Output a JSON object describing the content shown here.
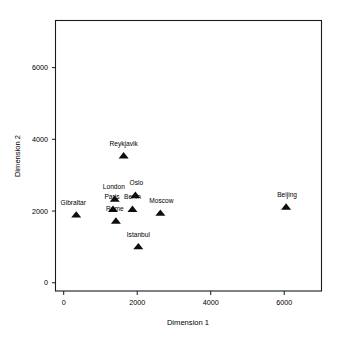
{
  "chart_data": {
    "type": "scatter",
    "title": "",
    "xlabel": "Dimension 1",
    "ylabel": "Dimension 2",
    "xlim": [
      -210,
      7000
    ],
    "ylim": [
      -230,
      7300
    ],
    "xticks": [
      0,
      2000,
      4000,
      6000
    ],
    "yticks": [
      0,
      2000,
      4000,
      6000
    ],
    "xticklabels": [
      "0",
      "2000",
      "4000",
      "6000"
    ],
    "yticklabels": [
      "0",
      "2000",
      "4000",
      "6000"
    ],
    "grid": false,
    "legend": false,
    "marker": "triangle",
    "marker_color": "#0d0d0d",
    "points": [
      {
        "label": "Gibraltar",
        "x": 340,
        "y": 1850,
        "label_dx": -3,
        "label_dy": -6
      },
      {
        "label": "Paris",
        "x": 1340,
        "y": 2010,
        "label_dx": -1,
        "label_dy": -6
      },
      {
        "label": "London",
        "x": 1390,
        "y": 2290,
        "label_dx": -1,
        "label_dy": -6
      },
      {
        "label": "Rome",
        "x": 1420,
        "y": 1680,
        "label_dx": -1,
        "label_dy": -6
      },
      {
        "label": "Reykjavik",
        "x": 1630,
        "y": 3500,
        "label_dx": 0,
        "label_dy": -6
      },
      {
        "label": "Berlin",
        "x": 1870,
        "y": 2010,
        "label_dx": 0,
        "label_dy": -6
      },
      {
        "label": "Oslo",
        "x": 1950,
        "y": 2400,
        "label_dx": 1,
        "label_dy": -6
      },
      {
        "label": "Istanbul",
        "x": 2030,
        "y": 965,
        "label_dx": 0,
        "label_dy": -6
      },
      {
        "label": "Moscow",
        "x": 2630,
        "y": 1900,
        "label_dx": 1,
        "label_dy": -6
      },
      {
        "label": "Beijing",
        "x": 6050,
        "y": 2070,
        "label_dx": 1,
        "label_dy": -6
      }
    ]
  }
}
